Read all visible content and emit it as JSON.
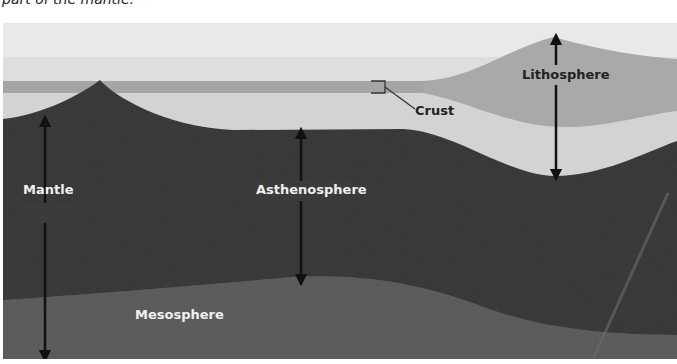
{
  "caption": "part of the mantle.",
  "labels": {
    "lithosphere": "Lithosphere",
    "crust": "Crust",
    "mantle": "Mantle",
    "asthenosphere": "Asthenosphere",
    "mesosphere": "Mesosphere"
  },
  "colors": {
    "sky": "#e8e8e8",
    "crust": "#a8a8a8",
    "lithosphere_upper": "#d2d2d2",
    "asthenosphere": "#3a3a3a",
    "mesosphere": "#5c5c5c",
    "arrow": "#111111"
  }
}
